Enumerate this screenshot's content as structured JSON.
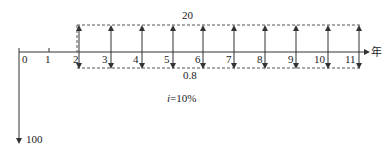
{
  "diagram": {
    "type": "cash-flow-diagram",
    "axis_unit": "年",
    "years": [
      "0",
      "1",
      "2",
      "3",
      "4",
      "5",
      "6",
      "7",
      "8",
      "9",
      "10",
      "11"
    ],
    "initial_outflow": {
      "year": "0",
      "label": "100",
      "direction": "down"
    },
    "inflow": {
      "from_year": "2",
      "to_year": "11",
      "label": "20",
      "direction": "up"
    },
    "outflow": {
      "from_year": "2",
      "to_year": "11",
      "label": "0.8",
      "direction": "down"
    },
    "interest_rate": {
      "symbol": "i",
      "value": "=10%"
    }
  },
  "colors": {
    "line": "#333333",
    "dash": "#555555",
    "text": "#222222",
    "background": "#ffffff"
  }
}
